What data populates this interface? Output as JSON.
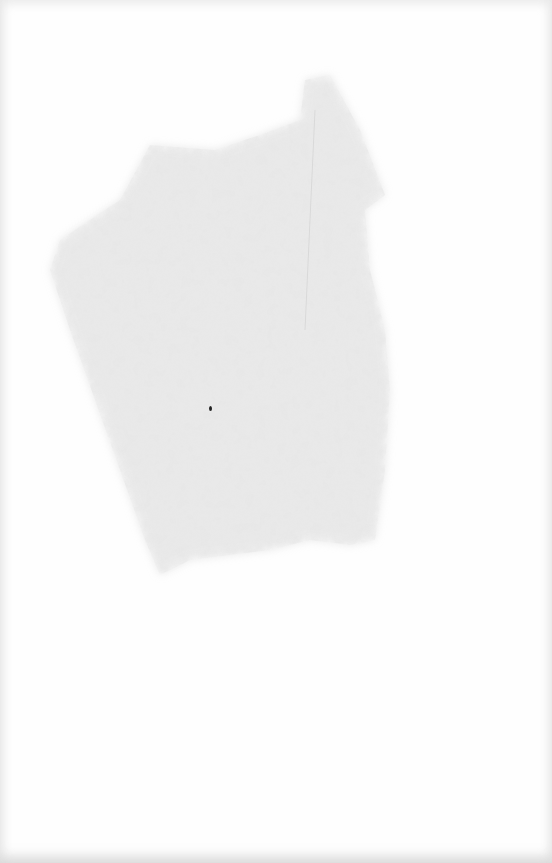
{
  "document": {
    "type": "blank scanned page",
    "text": "",
    "stain_color": "#d6d6d6",
    "speck_color": "#222222"
  }
}
